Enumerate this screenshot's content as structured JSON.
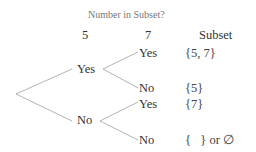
{
  "diagram": {
    "title": "Number in Subset?",
    "columns": [
      "5",
      "7",
      "Subset"
    ],
    "level1": [
      {
        "label": "Yes"
      },
      {
        "label": "No"
      }
    ],
    "level2": [
      {
        "label": "Yes",
        "subset": "{5, 7}"
      },
      {
        "label": "No",
        "subset": "{5}"
      },
      {
        "label": "Yes",
        "subset": "{7}"
      },
      {
        "label": "No",
        "subset": "{   } or ∅"
      }
    ],
    "line_color": "#aaaaaa"
  }
}
